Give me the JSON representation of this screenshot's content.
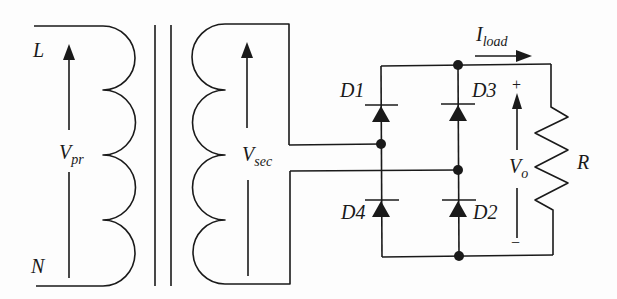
{
  "diagram": {
    "stroke_color": "#1a1a1a",
    "background": "#fdfdfd",
    "labels": {
      "line": "L",
      "neutral": "N",
      "v_primary_main": "V",
      "v_primary_sub": "pr",
      "v_secondary_main": "V",
      "v_secondary_sub": "sec",
      "i_load_main": "I",
      "i_load_sub": "load",
      "d1": "D1",
      "d2": "D2",
      "d3": "D3",
      "d4": "D4",
      "v_out_main": "V",
      "v_out_sub": "o",
      "plus": "+",
      "minus": "−",
      "resistor": "R"
    },
    "components": [
      {
        "id": "primary-winding",
        "type": "inductor",
        "turns": 4
      },
      {
        "id": "transformer-core",
        "type": "core",
        "lines": 2
      },
      {
        "id": "secondary-winding",
        "type": "inductor",
        "turns": 4
      },
      {
        "id": "D1",
        "type": "diode"
      },
      {
        "id": "D2",
        "type": "diode"
      },
      {
        "id": "D3",
        "type": "diode"
      },
      {
        "id": "D4",
        "type": "diode"
      },
      {
        "id": "R",
        "type": "resistor"
      }
    ]
  }
}
